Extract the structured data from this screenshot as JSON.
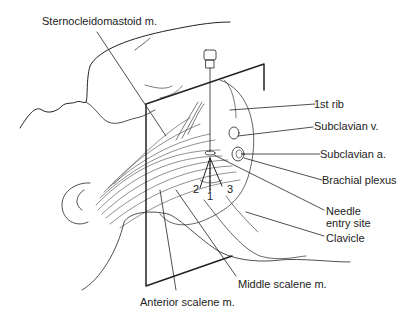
{
  "figure": {
    "labels": {
      "sternocleidomastoid": "Sternocleidomastoid m.",
      "first_rib": "1st rib",
      "subclavian_v": "Subclavian v.",
      "subclavian_a": "Subclavian a.",
      "brachial_plexus": "Brachial plexus",
      "needle_entry_line1": "Needle",
      "needle_entry_line2": "entry site",
      "clavicle": "Clavicle",
      "middle_scalene": "Middle scalene m.",
      "anterior_scalene": "Anterior scalene m."
    },
    "direction_numbers": [
      "1",
      "2",
      "3"
    ],
    "colors": {
      "line": "#222222",
      "background": "#ffffff"
    }
  }
}
